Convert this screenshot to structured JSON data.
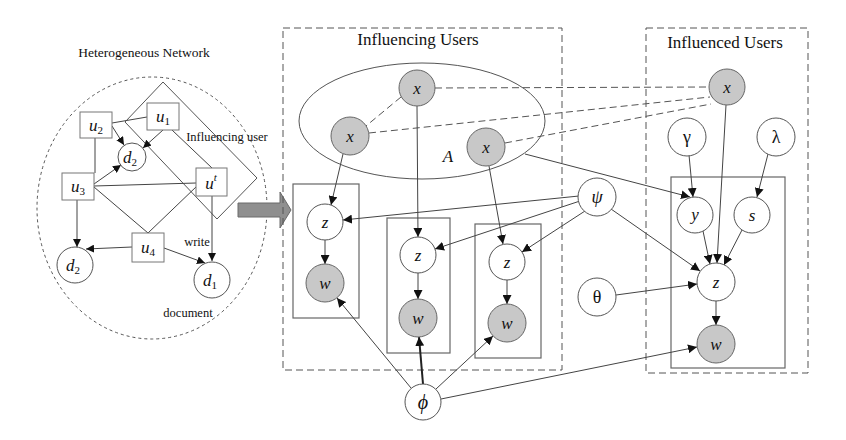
{
  "left_panel": {
    "title": "Heterogeneous Network",
    "influencing_user_label": "Influencing user",
    "write_label": "write",
    "document_label": "document",
    "nodes": {
      "u1": {
        "base": "u",
        "sub": "1"
      },
      "u2": {
        "base": "u",
        "sub": "2"
      },
      "u3": {
        "base": "u",
        "sub": "3"
      },
      "u4": {
        "base": "u",
        "sub": "4"
      },
      "ut": {
        "base": "u",
        "sup": "t"
      },
      "d2_upper": {
        "base": "d",
        "sub": "2"
      },
      "d2_lower": {
        "base": "d",
        "sub": "2"
      },
      "d1": {
        "base": "d",
        "sub": "1"
      }
    }
  },
  "transition_arrow": {
    "icon": "right-arrow-icon"
  },
  "middle_panel": {
    "title": "Influencing Users",
    "ellipse_label": "A",
    "nodes": {
      "x_top": "x",
      "x_left": "x",
      "x_right": "x",
      "z1": "z",
      "w1": "w",
      "z2": "z",
      "w2": "w",
      "z3": "z",
      "w3": "w",
      "phi": "ϕ",
      "psi": "ψ",
      "theta": "θ"
    }
  },
  "right_panel": {
    "title": "Influenced Users",
    "nodes": {
      "x": "x",
      "gamma": "γ",
      "lambda": "λ",
      "y": "y",
      "s": "s",
      "z": "z",
      "w": "w"
    }
  },
  "colors": {
    "observed_node_fill": "#c8c8c8",
    "latent_node_fill": "#ffffff",
    "arrow_fill": "#8f8f8f",
    "stroke": "#555555"
  }
}
